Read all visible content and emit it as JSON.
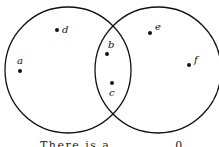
{
  "diagram": {
    "type": "venn",
    "sets": [
      {
        "name": "left-set",
        "elements_only": [
          "a",
          "d"
        ]
      },
      {
        "name": "right-set",
        "elements_only": [
          "e",
          "f"
        ]
      }
    ],
    "intersection": [
      "b",
      "c"
    ],
    "points": {
      "a": "a",
      "b": "b",
      "c": "c",
      "d": "d",
      "e": "e",
      "f": "f"
    }
  },
  "caption": "There is a ... ... ... 0"
}
